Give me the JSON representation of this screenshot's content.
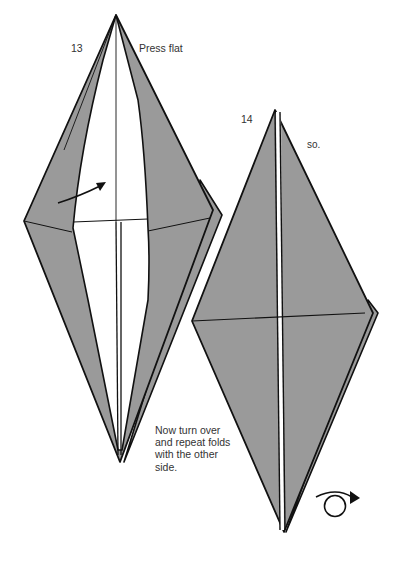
{
  "step13": {
    "number": "13",
    "caption": "Press flat"
  },
  "step14": {
    "number": "14",
    "caption": "so.",
    "instruction": "Now turn over and repeat folds with the other side."
  },
  "colors": {
    "paper_shade": "#9a9a9a",
    "paper_white": "#ffffff",
    "line": "#111111",
    "text": "#333333"
  },
  "icons": {
    "fold_arrow": "curved-arrow-icon",
    "turn_over": "turn-over-icon"
  }
}
